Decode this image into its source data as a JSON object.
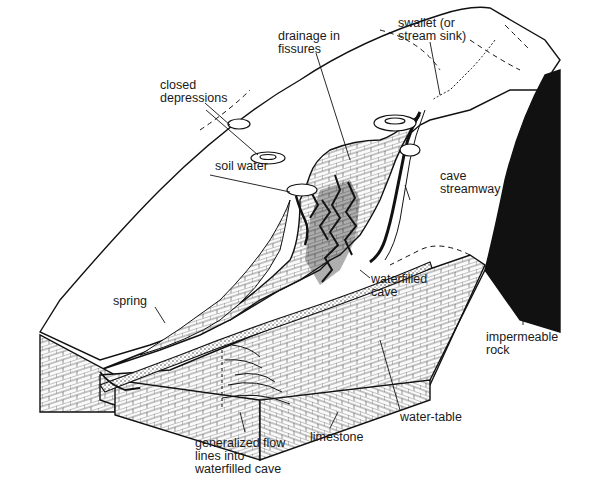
{
  "diagram": {
    "type": "karst hydrology block diagram",
    "colors": {
      "ink": "#111111",
      "paper": "#ffffff",
      "limestone_fill": "#f4f4f4"
    },
    "labels": {
      "swallet": "swallet (or\nstream sink)",
      "drainage_in_fissures": "drainage in\nfissures",
      "closed_depressions": "closed\ndepressions",
      "soil_water": "soil water",
      "cave_streamway": "cave\nstreamway",
      "waterfilled_cave": "waterfilled\ncave",
      "spring": "spring",
      "impermeable_rock": "impermeable\nrock",
      "generalized_flow_lines": "generalized flow\nlines into\nwaterfilled cave",
      "limestone": "limestone",
      "water_table": "water-table"
    }
  }
}
